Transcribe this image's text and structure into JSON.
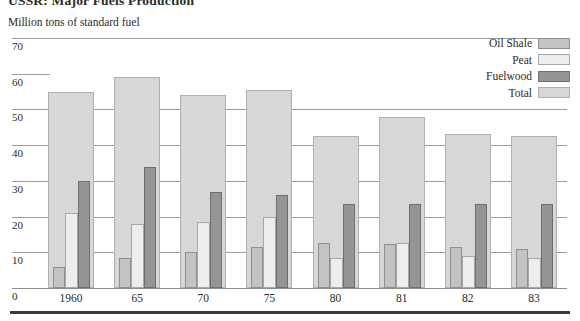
{
  "title": "USSR: Major Fuels Production",
  "axis_note": "Million tons of standard fuel",
  "colors": {
    "oil_shale": "#c3c3c3",
    "peat": "#ededed",
    "fuelwood": "#959595",
    "total": "#d7d7d7"
  },
  "legend": {
    "position": "top-right",
    "items": [
      {
        "label": "Oil Shale",
        "swatch": "oil-shale-swatch"
      },
      {
        "label": "Peat",
        "swatch": "peat-swatch"
      },
      {
        "label": "Fuelwood",
        "swatch": "fuelwood-swatch"
      },
      {
        "label": "Total",
        "swatch": "total-swatch"
      }
    ]
  },
  "chart_data": {
    "type": "bar",
    "title": "USSR: Major Fuels Production",
    "xlabel": "",
    "ylabel": "Million tons of standard fuel",
    "ylim": [
      0,
      70
    ],
    "yticks": [
      0,
      10,
      20,
      30,
      40,
      50,
      60,
      70
    ],
    "grid": true,
    "categories": [
      "1960",
      "65",
      "70",
      "75",
      "80",
      "81",
      "82",
      "83"
    ],
    "series": [
      {
        "name": "Oil Shale",
        "values": [
          6.0,
          8.5,
          10.0,
          11.5,
          12.5,
          12.3,
          11.5,
          11.0
        ]
      },
      {
        "name": "Peat",
        "values": [
          21.0,
          18.0,
          18.5,
          20.0,
          8.5,
          12.5,
          9.0,
          8.5
        ]
      },
      {
        "name": "Fuelwood",
        "values": [
          30.0,
          34.0,
          27.0,
          26.0,
          23.5,
          23.5,
          23.5,
          23.5
        ]
      },
      {
        "name": "Total",
        "values": [
          55.0,
          59.0,
          54.0,
          55.5,
          42.5,
          48.0,
          43.0,
          42.5
        ]
      }
    ]
  }
}
